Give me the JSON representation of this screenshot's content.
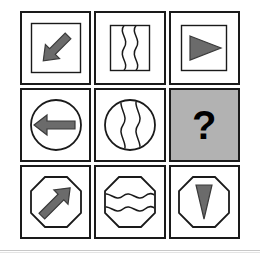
{
  "puzzle": {
    "type": "ravens-progressive-matrix",
    "rows": 3,
    "columns": 3,
    "missing_cell_index": 5,
    "missing_cell_label": "?",
    "colors": {
      "border": "#1a1a1a",
      "shape_outline": "#1a1a1a",
      "fill_gray": "#6b6b6b",
      "missing_cell_background": "#b2b2b2",
      "page_background": "#ffffff",
      "rule": "#c8c8c8"
    },
    "cells": [
      {
        "index": 0,
        "position": "row-1-col-1",
        "frame": "square",
        "content": "arrow-diagonal-down-left",
        "content_style": "filled-gray",
        "description": "Square outline containing a thick arrow pointing down-left"
      },
      {
        "index": 1,
        "position": "row-1-col-2",
        "frame": "square",
        "content": "two-vertical-wavy-lines",
        "content_style": "outline",
        "description": "Square outline containing two vertical wavy lines"
      },
      {
        "index": 2,
        "position": "row-1-col-3",
        "frame": "square",
        "content": "triangle-right",
        "content_style": "filled-gray",
        "description": "Square outline containing a right-pointing filled triangle"
      },
      {
        "index": 3,
        "position": "row-2-col-1",
        "frame": "circle",
        "content": "arrow-left",
        "content_style": "filled-gray",
        "description": "Circle outline containing a left-pointing arrow"
      },
      {
        "index": 4,
        "position": "row-2-col-2",
        "frame": "circle",
        "content": "two-vertical-wavy-lines",
        "content_style": "outline",
        "description": "Circle outline containing two vertical wavy lines"
      },
      {
        "index": 5,
        "position": "row-2-col-3",
        "frame": "none",
        "content": "question-mark",
        "content_style": "missing",
        "description": "Gray shaded cell with a black question mark marking the missing answer"
      },
      {
        "index": 6,
        "position": "row-3-col-1",
        "frame": "octagon",
        "content": "arrow-diagonal-up-left",
        "content_style": "filled-gray",
        "description": "Octagon outline containing a thick arrow pointing up-left"
      },
      {
        "index": 7,
        "position": "row-3-col-2",
        "frame": "octagon",
        "content": "two-horizontal-wavy-lines",
        "content_style": "outline",
        "description": "Octagon outline containing two horizontal wavy lines"
      },
      {
        "index": 8,
        "position": "row-3-col-3",
        "frame": "octagon",
        "content": "triangle-down",
        "content_style": "filled-gray",
        "description": "Octagon outline containing a downward-pointing filled triangle"
      }
    ]
  }
}
